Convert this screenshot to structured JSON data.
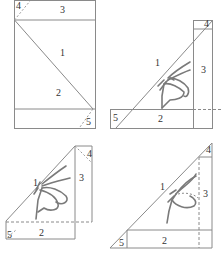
{
  "figure": {
    "panels": [
      {
        "id": "panel-a",
        "labels": {
          "1": "1",
          "2": "2",
          "3": "3",
          "4": "4",
          "5": "5"
        }
      },
      {
        "id": "panel-b",
        "labels": {
          "1": "1",
          "2": "2",
          "3": "3",
          "4": "4",
          "5": "5"
        }
      },
      {
        "id": "panel-c",
        "labels": {
          "1": "1",
          "2": "2",
          "3": "3",
          "4": "4",
          "5": "5"
        }
      },
      {
        "id": "panel-d",
        "labels": {
          "1": "1",
          "2": "2",
          "3": "3",
          "4": "4",
          "5": "5"
        }
      }
    ],
    "colors": {
      "line": "#8a8a8a",
      "butterfly": "#7a7a7a",
      "text": "#333333"
    }
  }
}
